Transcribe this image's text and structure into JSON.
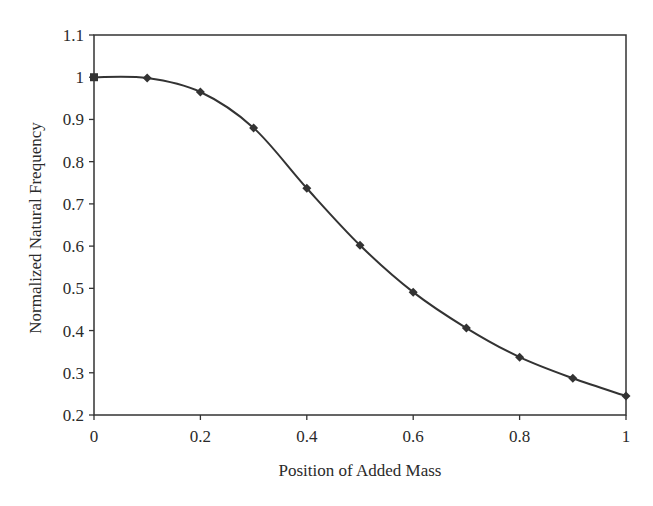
{
  "chart_data": {
    "type": "line",
    "title": "",
    "xlabel": "Position of Added Mass",
    "ylabel": "Normalized Natural Frequency",
    "xlim": [
      0,
      1
    ],
    "ylim": [
      0.2,
      1.1
    ],
    "grid": false,
    "legend": null,
    "x_ticks": [
      "0",
      "0.2",
      "0.4",
      "0.6",
      "0.8",
      "1"
    ],
    "x_tick_values": [
      0,
      0.2,
      0.4,
      0.6,
      0.8,
      1.0
    ],
    "y_ticks": [
      "1.1",
      "1",
      "0.9",
      "0.8",
      "0.7",
      "0.6",
      "0.5",
      "0.4",
      "0.3",
      "0.2"
    ],
    "y_tick_values": [
      1.1,
      1.0,
      0.9,
      0.8,
      0.7,
      0.6,
      0.5,
      0.4,
      0.3,
      0.2
    ],
    "series": [
      {
        "name": "Normalized Natural Frequency",
        "color": "#333333",
        "marker": "diamond",
        "x": [
          0,
          0.1,
          0.2,
          0.3,
          0.4,
          0.5,
          0.6,
          0.7,
          0.8,
          0.9,
          1.0
        ],
        "values": [
          1.0,
          0.998,
          0.965,
          0.88,
          0.737,
          0.602,
          0.491,
          0.406,
          0.337,
          0.287,
          0.245
        ]
      }
    ]
  },
  "colors": {
    "line": "#333333",
    "axis": "#333333",
    "background": "#ffffff"
  }
}
